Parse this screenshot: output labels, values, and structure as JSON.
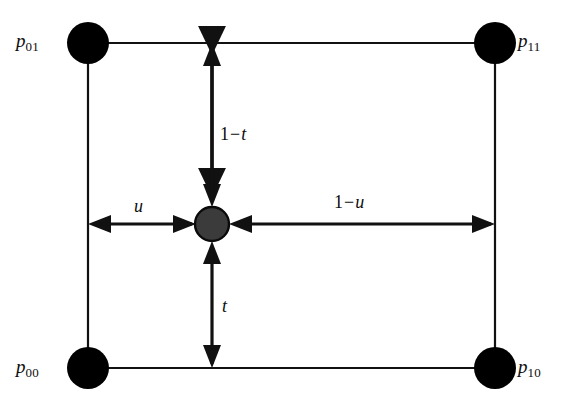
{
  "figure": {
    "background_color": "#ffffff",
    "stroke_color": "#111111",
    "node_fill": "#000000",
    "center_fill": "#3b3b3b",
    "corners": [
      {
        "id": "p01",
        "label_p": "p",
        "label_sub": "01",
        "x": 88,
        "y": 43,
        "label_x": 16,
        "label_y": 31,
        "label_side": "left"
      },
      {
        "id": "p11",
        "label_p": "p",
        "label_sub": "11",
        "x": 495,
        "y": 43,
        "label_x": 518,
        "label_y": 31,
        "label_side": "right"
      },
      {
        "id": "p00",
        "label_p": "p",
        "label_sub": "00",
        "x": 88,
        "y": 368,
        "label_x": 16,
        "label_y": 357,
        "label_side": "left"
      },
      {
        "id": "p10",
        "label_p": "p",
        "label_sub": "10",
        "x": 495,
        "y": 368,
        "label_x": 518,
        "label_y": 357,
        "label_side": "right"
      }
    ],
    "center_point": {
      "id": "interior-point",
      "x": 212,
      "y": 224,
      "radius": 17
    },
    "node_radius": 21,
    "rect": {
      "left": 88,
      "top": 43,
      "right": 495,
      "bottom": 368
    },
    "parameters": [
      {
        "id": "u",
        "num": "",
        "op": "",
        "var": "u",
        "text": "u",
        "x": 134,
        "y": 197,
        "orientation": "horizontal",
        "from": 88,
        "to": 212
      },
      {
        "id": "one-minus-u",
        "num": "1",
        "op": "−",
        "var": "u",
        "text": "1−u",
        "x": 334,
        "y": 193,
        "orientation": "horizontal",
        "from": 212,
        "to": 495
      },
      {
        "id": "one-minus-t",
        "num": "1",
        "op": "−",
        "var": "t",
        "text": "1−t",
        "x": 220,
        "y": 125,
        "orientation": "vertical",
        "from": 43,
        "to": 224
      },
      {
        "id": "t",
        "num": "",
        "op": "",
        "var": "t",
        "text": "t",
        "x": 222,
        "y": 297,
        "orientation": "vertical",
        "from": 224,
        "to": 368
      }
    ]
  }
}
